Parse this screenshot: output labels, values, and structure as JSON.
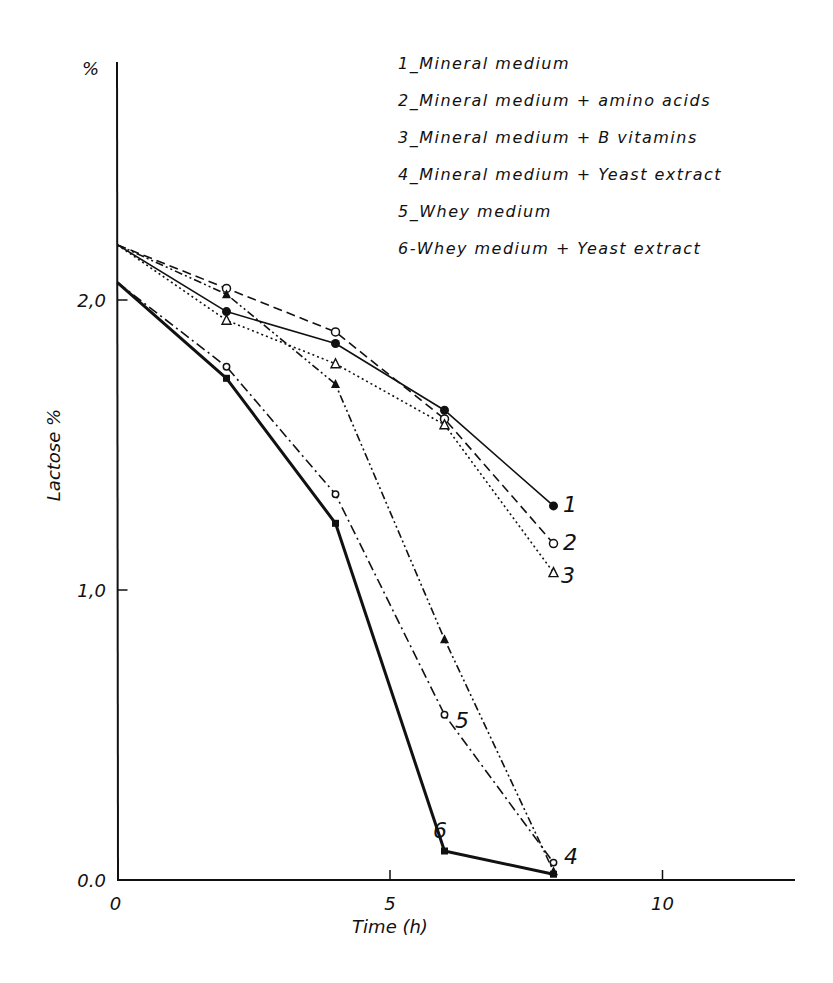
{
  "chart_data": {
    "type": "line",
    "title": "",
    "xlabel": "Time (h)",
    "ylabel": "Lactose %",
    "y_unit_label": "%",
    "xlim": [
      0,
      12.5
    ],
    "ylim": [
      0,
      2.6
    ],
    "x_ticks": [
      0,
      5,
      10
    ],
    "x_tick_labels": [
      "0",
      "5",
      "10"
    ],
    "y_ticks": [
      0.0,
      1.0,
      2.0
    ],
    "y_tick_labels": [
      "0.0",
      "1,0",
      "2,0"
    ],
    "grid": false,
    "legend_position": "top-right",
    "x": [
      0,
      2,
      4,
      6,
      8
    ],
    "series": [
      {
        "id": "1",
        "name": "1_Mineral medium",
        "values": [
          2.19,
          1.96,
          1.85,
          1.62,
          1.29
        ],
        "marker": "filled-circle",
        "line": "solid"
      },
      {
        "id": "2",
        "name": "2_Mineral medium + amino acids",
        "values": [
          2.19,
          2.04,
          1.89,
          1.59,
          1.16
        ],
        "marker": "open-circle",
        "line": "dashed"
      },
      {
        "id": "3",
        "name": "3_Mineral medium + B vitamins",
        "values": [
          2.19,
          1.93,
          1.78,
          1.57,
          1.06
        ],
        "marker": "open-triangle",
        "line": "dotted"
      },
      {
        "id": "4",
        "name": "4_Mineral medium + Yeast extract",
        "values": [
          2.19,
          2.02,
          1.71,
          0.83,
          0.03
        ],
        "marker": "filled-triangle",
        "line": "dash-dot-dot"
      },
      {
        "id": "5",
        "name": "5_Whey medium",
        "values": [
          2.06,
          1.77,
          1.33,
          0.57,
          0.06
        ],
        "marker": "open-circle-small",
        "line": "dash-dot"
      },
      {
        "id": "6",
        "name": "6-Whey medium + Yeast extract",
        "values": [
          2.06,
          1.73,
          1.23,
          0.1,
          0.02
        ],
        "marker": "filled-square",
        "line": "thick-solid"
      }
    ],
    "curve_labels": [
      "1",
      "2",
      "3",
      "4",
      "5",
      "6"
    ]
  },
  "legend": [
    "1_Mineral  medium",
    "2_Mineral  medium  + amino acids",
    "3_Mineral  medium  + B  vitamins",
    "4_Mineral medium  + Yeast extract",
    "5_Whey  medium",
    "6-Whey medium   + Yeast extract"
  ]
}
